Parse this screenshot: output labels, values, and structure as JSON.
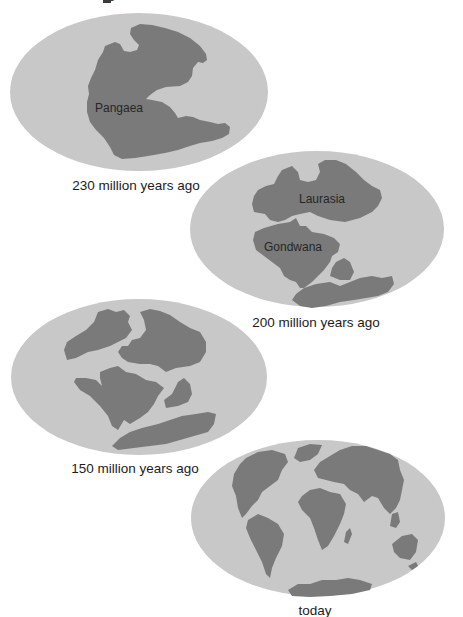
{
  "title_fragment": "g",
  "colors": {
    "ocean": "#c8c8c8",
    "land": "#7a7a7a",
    "text": "#1c1c1c",
    "background": "#ffffff"
  },
  "panels": [
    {
      "id": "pangaea",
      "caption": "230 million years ago",
      "labels": [
        "Pangaea"
      ]
    },
    {
      "id": "laurasia-gondwana",
      "caption": "200 million years ago",
      "labels": [
        "Laurasia",
        "Gondwana"
      ]
    },
    {
      "id": "breakup",
      "caption": "150 million years ago",
      "labels": []
    },
    {
      "id": "today",
      "caption": "today",
      "labels": []
    }
  ]
}
